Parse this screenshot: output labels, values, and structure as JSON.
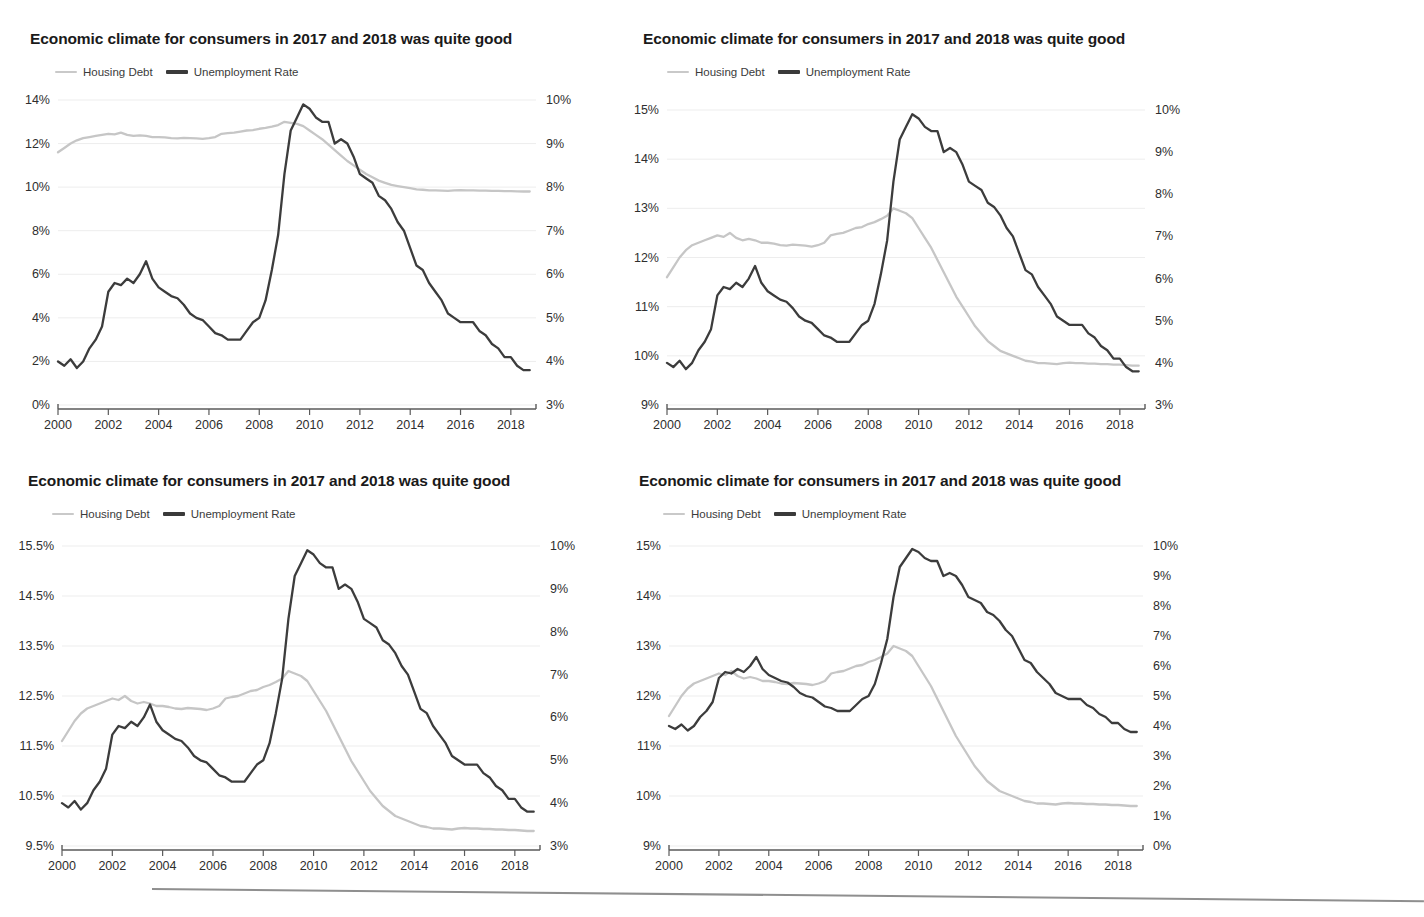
{
  "page": {
    "background": "#ffffff",
    "footer_rule": true
  },
  "common": {
    "title": "Economic climate for consumers in 2017 and 2018 was quite good",
    "legend": [
      {
        "label": "Housing Debt",
        "color": "#c6c6c6",
        "key": "housing_debt"
      },
      {
        "label": "Unemployment Rate",
        "color": "#3c3c3c",
        "key": "unemployment_rate"
      }
    ],
    "x_tick_labels": [
      "2000",
      "2002",
      "2004",
      "2006",
      "2008",
      "2010",
      "2012",
      "2014",
      "2016",
      "2018"
    ],
    "x_range": [
      2000,
      2019
    ]
  },
  "chart_data": [
    {
      "id": "panel-top-left",
      "type": "line",
      "title": "Economic climate for consumers in 2017 and 2018 was quite good",
      "xlabel": "",
      "grid": true,
      "legend_position": "top-left",
      "x": [
        2000.0,
        2000.25,
        2000.5,
        2000.75,
        2001.0,
        2001.25,
        2001.5,
        2001.75,
        2002.0,
        2002.25,
        2002.5,
        2002.75,
        2003.0,
        2003.25,
        2003.5,
        2003.75,
        2004.0,
        2004.25,
        2004.5,
        2004.75,
        2005.0,
        2005.25,
        2005.5,
        2005.75,
        2006.0,
        2006.25,
        2006.5,
        2006.75,
        2007.0,
        2007.25,
        2007.5,
        2007.75,
        2008.0,
        2008.25,
        2008.5,
        2008.75,
        2009.0,
        2009.25,
        2009.5,
        2009.75,
        2010.0,
        2010.25,
        2010.5,
        2010.75,
        2011.0,
        2011.25,
        2011.5,
        2011.75,
        2012.0,
        2012.25,
        2012.5,
        2012.75,
        2013.0,
        2013.25,
        2013.5,
        2013.75,
        2014.0,
        2014.25,
        2014.5,
        2014.75,
        2015.0,
        2015.25,
        2015.5,
        2015.75,
        2016.0,
        2016.25,
        2016.5,
        2016.75,
        2017.0,
        2017.25,
        2017.5,
        2017.75,
        2018.0,
        2018.25,
        2018.5,
        2018.75
      ],
      "series": [
        {
          "name": "Housing Debt",
          "axis": "left",
          "unit": "%",
          "color": "#c6c6c6",
          "values": [
            11.6,
            11.8,
            12.0,
            12.15,
            12.25,
            12.3,
            12.35,
            12.4,
            12.45,
            12.42,
            12.5,
            12.4,
            12.35,
            12.38,
            12.35,
            12.3,
            12.3,
            12.28,
            12.25,
            12.24,
            12.26,
            12.25,
            12.24,
            12.22,
            12.25,
            12.3,
            12.45,
            12.48,
            12.5,
            12.55,
            12.6,
            12.62,
            12.68,
            12.72,
            12.78,
            12.85,
            13.0,
            12.95,
            12.9,
            12.8,
            12.6,
            12.4,
            12.2,
            11.95,
            11.7,
            11.45,
            11.2,
            11.0,
            10.8,
            10.6,
            10.45,
            10.3,
            10.2,
            10.1,
            10.05,
            10.0,
            9.95,
            9.9,
            9.88,
            9.85,
            9.85,
            9.84,
            9.83,
            9.85,
            9.86,
            9.85,
            9.85,
            9.84,
            9.84,
            9.83,
            9.83,
            9.82,
            9.82,
            9.81,
            9.8,
            9.8
          ]
        },
        {
          "name": "Unemployment Rate",
          "axis": "right",
          "unit": "%",
          "color": "#3c3c3c",
          "values": [
            4.0,
            3.9,
            4.05,
            3.85,
            4.0,
            4.3,
            4.5,
            4.8,
            5.6,
            5.8,
            5.75,
            5.9,
            5.8,
            6.0,
            6.3,
            5.9,
            5.7,
            5.6,
            5.5,
            5.45,
            5.3,
            5.1,
            5.0,
            4.95,
            4.8,
            4.65,
            4.6,
            4.5,
            4.5,
            4.5,
            4.7,
            4.9,
            5.0,
            5.4,
            6.1,
            6.9,
            8.3,
            9.3,
            9.6,
            9.9,
            9.8,
            9.6,
            9.5,
            9.5,
            9.0,
            9.1,
            9.0,
            8.7,
            8.3,
            8.2,
            8.1,
            7.8,
            7.7,
            7.5,
            7.2,
            7.0,
            6.6,
            6.2,
            6.1,
            5.8,
            5.6,
            5.4,
            5.1,
            5.0,
            4.9,
            4.9,
            4.9,
            4.7,
            4.6,
            4.4,
            4.3,
            4.1,
            4.1,
            3.9,
            3.8,
            3.8
          ]
        }
      ],
      "left_axis": {
        "ticks": [
          "0%",
          "2%",
          "4%",
          "6%",
          "8%",
          "10%",
          "12%",
          "14%"
        ],
        "min": 0,
        "max": 14,
        "step": 2
      },
      "right_axis": {
        "ticks": [
          "3%",
          "4%",
          "5%",
          "6%",
          "7%",
          "8%",
          "9%",
          "10%"
        ],
        "min": 3,
        "max": 10,
        "step": 1
      }
    },
    {
      "id": "panel-top-right",
      "type": "line",
      "title": "Economic climate for consumers in 2017 and 2018 was quite good",
      "grid": true,
      "legend_position": "top-left",
      "left_axis": {
        "ticks": [
          "9%",
          "10%",
          "11%",
          "12%",
          "13%",
          "14%",
          "15%"
        ],
        "min": 9,
        "max": 15,
        "step": 1
      },
      "right_axis": {
        "ticks": [
          "3%",
          "4%",
          "5%",
          "6%",
          "7%",
          "8%",
          "9%",
          "10%"
        ],
        "min": 3,
        "max": 10,
        "step": 1
      }
    },
    {
      "id": "panel-bottom-left",
      "type": "line",
      "title": "Economic climate for consumers in 2017 and 2018 was quite good",
      "grid": true,
      "legend_position": "top-left",
      "left_axis": {
        "ticks": [
          "9.5%",
          "10.5%",
          "11.5%",
          "12.5%",
          "13.5%",
          "14.5%",
          "15.5%"
        ],
        "min": 9.5,
        "max": 15.5,
        "step": 1
      },
      "right_axis": {
        "ticks": [
          "3%",
          "4%",
          "5%",
          "6%",
          "7%",
          "8%",
          "9%",
          "10%"
        ],
        "min": 3,
        "max": 10,
        "step": 1
      }
    },
    {
      "id": "panel-bottom-right",
      "type": "line",
      "title": "Economic climate for consumers in 2017 and 2018 was quite good",
      "grid": true,
      "legend_position": "top-left",
      "left_axis": {
        "ticks": [
          "9%",
          "10%",
          "11%",
          "12%",
          "13%",
          "14%",
          "15%"
        ],
        "min": 9,
        "max": 15,
        "step": 1
      },
      "right_axis": {
        "ticks": [
          "0%",
          "1%",
          "2%",
          "3%",
          "4%",
          "5%",
          "6%",
          "7%",
          "8%",
          "9%",
          "10%"
        ],
        "min": 0,
        "max": 10,
        "step": 1
      }
    }
  ]
}
